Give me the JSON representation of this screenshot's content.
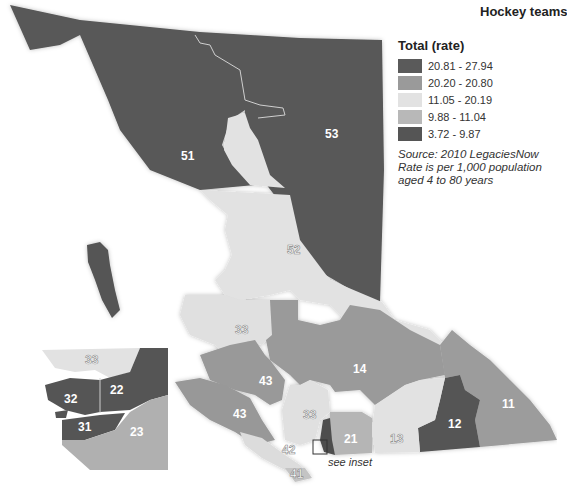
{
  "title": "Hockey teams",
  "legend": {
    "title": "Total (rate)",
    "classes": [
      {
        "label": "20.81 - 27.94",
        "color": "#5a5a5a"
      },
      {
        "label": "20.20 - 20.80",
        "color": "#9a9a9a"
      },
      {
        "label": "11.05 - 20.19",
        "color": "#e2e2e2"
      },
      {
        "label": "9.88 - 11.04",
        "color": "#b8b8b8"
      },
      {
        "label": "3.72 - 9.87",
        "color": "#555555"
      }
    ]
  },
  "notes": {
    "source": "Source: 2010 LegaciesNow",
    "line2": "Rate is per 1,000 population",
    "line3": "aged 4 to 80 years"
  },
  "inset_caption": "see inset",
  "regions": [
    {
      "id": "53"
    },
    {
      "id": "51"
    },
    {
      "id": "52"
    },
    {
      "id": "33"
    },
    {
      "id": "14"
    },
    {
      "id": "43"
    },
    {
      "id": "43b"
    },
    {
      "id": "11"
    },
    {
      "id": "12"
    },
    {
      "id": "21"
    },
    {
      "id": "13"
    },
    {
      "id": "42"
    },
    {
      "id": "41"
    },
    {
      "id": "22"
    },
    {
      "id": "32"
    },
    {
      "id": "31"
    },
    {
      "id": "23"
    }
  ],
  "labels": {
    "r53": "53",
    "r51": "51",
    "r52": "52",
    "r33": "33",
    "r14": "14",
    "r43a": "43",
    "r43b": "43",
    "r11": "11",
    "r12": "12",
    "r21": "21",
    "r13": "13",
    "r42": "42",
    "r41": "41",
    "r33s": "33",
    "i33": "33",
    "i22": "22",
    "i32": "32",
    "i31": "31",
    "i23": "23"
  }
}
